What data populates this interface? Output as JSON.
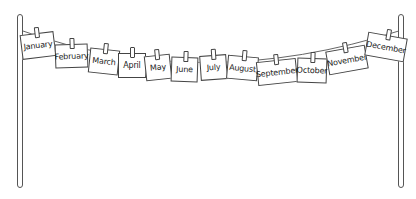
{
  "months": [
    {
      "label": "January",
      "x": 21,
      "y": 33,
      "w": 34,
      "h": 25,
      "rot": -7
    },
    {
      "label": "February",
      "x": 55,
      "y": 44,
      "w": 33,
      "h": 24,
      "rot": -2
    },
    {
      "label": "March",
      "x": 89,
      "y": 49,
      "w": 30,
      "h": 25,
      "rot": 6
    },
    {
      "label": "April",
      "x": 118,
      "y": 53,
      "w": 28,
      "h": 25,
      "rot": 0
    },
    {
      "label": "May",
      "x": 145,
      "y": 55,
      "w": 26,
      "h": 25,
      "rot": -6
    },
    {
      "label": "June",
      "x": 171,
      "y": 57,
      "w": 27,
      "h": 25,
      "rot": 2
    },
    {
      "label": "July",
      "x": 200,
      "y": 55,
      "w": 27,
      "h": 25,
      "rot": -4
    },
    {
      "label": "August",
      "x": 227,
      "y": 56,
      "w": 31,
      "h": 24,
      "rot": 5
    },
    {
      "label": "September",
      "x": 257,
      "y": 60,
      "w": 40,
      "h": 24,
      "rot": -6
    },
    {
      "label": "October",
      "x": 297,
      "y": 58,
      "w": 30,
      "h": 25,
      "rot": 2
    },
    {
      "label": "November",
      "x": 327,
      "y": 48,
      "w": 40,
      "h": 24,
      "rot": -10
    },
    {
      "label": "December",
      "x": 366,
      "y": 35,
      "w": 40,
      "h": 24,
      "rot": 10
    }
  ],
  "colors": {
    "line": "#444444",
    "card": "#ffffff",
    "text": "#222222"
  }
}
